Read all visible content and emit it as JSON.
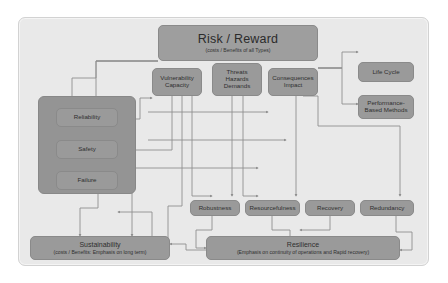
{
  "diagram": {
    "colors": {
      "canvas": "#e9e9e9",
      "node": "#9a9a9a",
      "node_border": "#8a8a8a",
      "group_panel": "#949494",
      "connector": "#8f8f8f",
      "text": "#2f2f2f"
    }
  },
  "nodes": {
    "risk": {
      "title": "Risk / Reward",
      "subtitle": "(costs / Benefits of all Types)"
    },
    "vulnerability": {
      "line1": "Vulnerability",
      "line2": "Capacity"
    },
    "threats": {
      "line1": "Threats",
      "line2": "Hazards",
      "line3": "Demands"
    },
    "consequences": {
      "line1": "Consequences",
      "line2": "Impact"
    },
    "life_cycle": {
      "label": "Life Cycle"
    },
    "performance": {
      "line1": "Performance-",
      "line2": "Based Methods"
    },
    "reliability": {
      "label": "Reliability"
    },
    "safety": {
      "label": "Safety"
    },
    "failure": {
      "label": "Failure"
    },
    "robustness": {
      "label": "Robustness"
    },
    "resourcefulness": {
      "label": "Resourcefulness"
    },
    "recovery": {
      "label": "Recovery"
    },
    "redundancy": {
      "label": "Redundancy"
    },
    "sustainability": {
      "title": "Sustainability",
      "subtitle": "(costs / Benefits: Emphasis on long term)"
    },
    "resilience": {
      "title": "Resilience",
      "subtitle": "(Emphasis on continuity of operations and Rapid recovery)"
    }
  }
}
